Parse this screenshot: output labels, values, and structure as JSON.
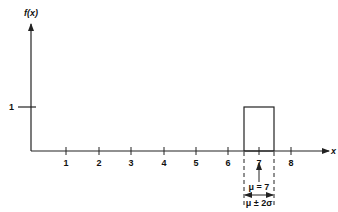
{
  "diagram": {
    "type": "uniform-distribution-plot",
    "y_axis": {
      "label": "f(x)",
      "tick_labels": [
        "1"
      ]
    },
    "x_axis": {
      "label": "x",
      "tick_labels": [
        "1",
        "2",
        "3",
        "4",
        "5",
        "6",
        "7",
        "8"
      ]
    },
    "distribution": {
      "height": 1,
      "lower": 6.5,
      "upper": 7.5,
      "mean_label": "μ = 7",
      "range_label": "μ ± 2σ"
    },
    "colors": {
      "stroke": "#222222",
      "background": "#ffffff"
    }
  }
}
